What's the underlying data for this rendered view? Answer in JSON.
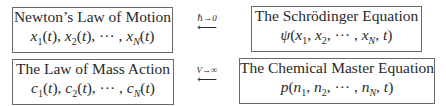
{
  "diagram": {
    "rows": [
      {
        "left": {
          "title": "Newton’s Law of Motion",
          "formula": "x₁(t), x₂(t), ··· , x_N(t)"
        },
        "arrow": {
          "condition": "ℏ→0",
          "direction": "⟵"
        },
        "right": {
          "title": "The Schrödinger Equation",
          "formula": "ψ(x₁, x₂, ··· , x_N, t)"
        }
      },
      {
        "left": {
          "title": "The Law of Mass Action",
          "formula": "c₁(t), c₂(t), ··· , c_N(t)"
        },
        "arrow": {
          "condition": "V→∞",
          "direction": "⟵"
        },
        "right": {
          "title": "The Chemical Master Equation",
          "formula": "p(n₁, n₂, ··· , n_N, t)"
        }
      }
    ]
  }
}
